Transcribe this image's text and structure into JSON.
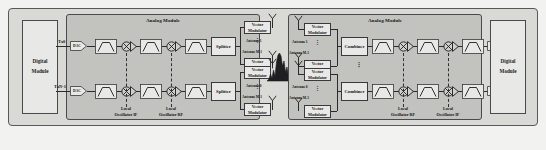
{
  "diagram": {
    "colors": {
      "page_background": "#f2f2f0",
      "outer_frame": "#d9d9d6",
      "analog_module": "#c2c2bf",
      "block_fill": "#e8e8e6",
      "line": "#2b2b2d"
    }
  },
  "transmit": {
    "digital_module": {
      "line1": "Digital",
      "line2": "Module"
    },
    "analog_module_title": "Analog Module",
    "ports": [
      {
        "id": "tx0",
        "label": "Tx0"
      },
      {
        "id": "txn1",
        "label": "TxN-1"
      }
    ],
    "converters": [
      {
        "id": "dac-top",
        "label": "DAC"
      },
      {
        "id": "dac-bottom",
        "label": "DAC"
      }
    ],
    "filters": [
      {
        "id": "tx-filter-1-top",
        "kind": "bandpass"
      },
      {
        "id": "tx-filter-2-top",
        "kind": "bandpass"
      },
      {
        "id": "tx-filter-3-top",
        "kind": "bandpass"
      },
      {
        "id": "tx-filter-1-bottom",
        "kind": "bandpass"
      },
      {
        "id": "tx-filter-2-bottom",
        "kind": "bandpass"
      },
      {
        "id": "tx-filter-3-bottom",
        "kind": "bandpass"
      }
    ],
    "oscillators": [
      {
        "id": "tx-lo-if",
        "line1": "Local",
        "line2": "Oscillator IF"
      },
      {
        "id": "tx-lo-rf",
        "line1": "Local",
        "line2": "Oscillator RF"
      }
    ],
    "splitters": [
      {
        "id": "splitter-top",
        "label": "Splitter"
      },
      {
        "id": "splitter-bottom",
        "label": "Splitter"
      }
    ],
    "vector_modulators": [
      {
        "id": "tx-vm-1",
        "line1": "Vector",
        "line2": "Modulator"
      },
      {
        "id": "tx-vm-2",
        "line1": "Vector",
        "line2": "Modulator"
      },
      {
        "id": "tx-vm-3",
        "line1": "Vector",
        "line2": "Modulator"
      },
      {
        "id": "tx-vm-4",
        "line1": "Vector",
        "line2": "Modulator"
      }
    ],
    "antenna_labels": [
      {
        "id": "tx-ant-1",
        "label": "Antenna 1"
      },
      {
        "id": "tx-ant-m1",
        "label": "Antenna M-1"
      },
      {
        "id": "tx-ant-0",
        "label": "Antenna 0"
      },
      {
        "id": "tx-ant-m1b",
        "label": "Antenna M-1"
      }
    ],
    "ellipsis": "⋮"
  },
  "receive": {
    "digital_module": {
      "line1": "Digital",
      "line2": "Module"
    },
    "analog_module_title": "Analog Module",
    "ports": [
      {
        "id": "rx0",
        "label": "Rx0"
      },
      {
        "id": "rxn1",
        "label": "RxN-1"
      }
    ],
    "converters": [
      {
        "id": "adc-top",
        "label": "ADC"
      },
      {
        "id": "adc-bottom",
        "label": "ADC"
      }
    ],
    "oscillators": [
      {
        "id": "rx-lo-rf",
        "line1": "Local",
        "line2": "Oscillator RF"
      },
      {
        "id": "rx-lo-if",
        "line1": "Local",
        "line2": "Oscillator IF"
      }
    ],
    "combiners": [
      {
        "id": "combiner-top",
        "label": "Combiner"
      },
      {
        "id": "combiner-bottom",
        "label": "Combiner"
      }
    ],
    "vector_modulators": [
      {
        "id": "rx-vm-1",
        "line1": "Vector",
        "line2": "Modulator"
      },
      {
        "id": "rx-vm-2",
        "line1": "Vector",
        "line2": "Modulator"
      },
      {
        "id": "rx-vm-3",
        "line1": "Vector",
        "line2": "Modulator"
      },
      {
        "id": "rx-vm-4",
        "line1": "Vector",
        "line2": "Modulator"
      }
    ],
    "antenna_labels": [
      {
        "id": "rx-ant-1",
        "label": "Antenna 1"
      },
      {
        "id": "rx-ant-m1",
        "label": "Antenna M-1"
      },
      {
        "id": "rx-ant-0",
        "label": "Antenna 0"
      },
      {
        "id": "rx-ant-m1b",
        "label": "Antenna M-1"
      }
    ],
    "ellipsis": "⋮"
  },
  "channel": {
    "icon": "spectrum-plot"
  }
}
